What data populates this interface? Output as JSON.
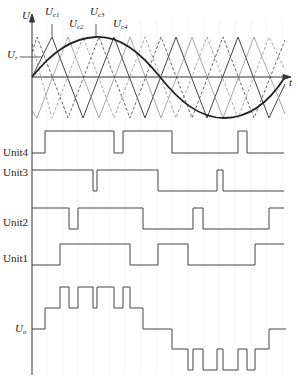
{
  "diagram": {
    "axes": {
      "y_label": "U",
      "x_label": "t"
    },
    "reference": {
      "label": "U",
      "subscript": "r"
    },
    "carriers": [
      {
        "label": "U",
        "subscript": "c1",
        "style": "solid-dark"
      },
      {
        "label": "U",
        "subscript": "c2",
        "style": "solid-light"
      },
      {
        "label": "U",
        "subscript": "c3",
        "style": "dashed-dark"
      },
      {
        "label": "U",
        "subscript": "c4",
        "style": "dashed-light"
      }
    ],
    "units": [
      {
        "label": "Unit4"
      },
      {
        "label": "Unit3"
      },
      {
        "label": "Unit2"
      },
      {
        "label": "Unit1"
      }
    ],
    "output": {
      "label": "U",
      "subscript": "o"
    },
    "colors": {
      "line": "#333333",
      "light_line": "#9a9a9a",
      "grid": "#e6e6e6",
      "background": "#ffffff"
    }
  }
}
